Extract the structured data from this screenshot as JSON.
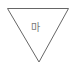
{
  "shape": {
    "type": "inverted-triangle",
    "stroke_color": "#666666",
    "fill_color": "#ffffff",
    "label": "마"
  }
}
